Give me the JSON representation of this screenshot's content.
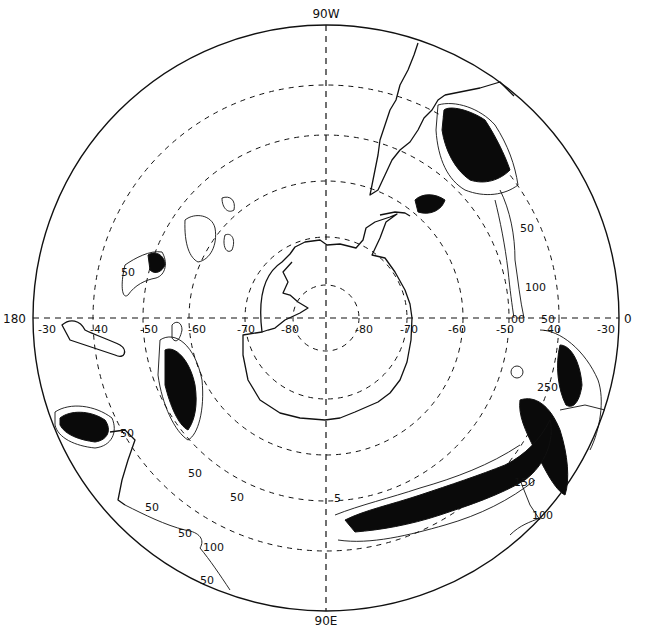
{
  "map": {
    "projection": "south polar stereographic",
    "center": {
      "x": 326,
      "y": 318
    },
    "outer_radius": 293,
    "meridian_labels": {
      "top": "90W",
      "bottom": "90E",
      "left": "180",
      "right": "0"
    },
    "latitude_labels_left": [
      "-30",
      "-40",
      "-50",
      "-60",
      "-70",
      "-80"
    ],
    "latitude_labels_right": [
      "-80",
      "-70",
      "-60",
      "-50",
      "-40",
      "-30"
    ],
    "latitude_circles": [
      {
        "lat": -80,
        "radius": 33
      },
      {
        "lat": -70,
        "radius": 81
      },
      {
        "lat": -60,
        "radius": 137
      },
      {
        "lat": -50,
        "radius": 183
      },
      {
        "lat": -40,
        "radius": 233
      },
      {
        "lat": -30,
        "radius": 293
      }
    ],
    "contour_labels": [
      {
        "text": "50",
        "x": 121,
        "y": 276
      },
      {
        "text": "50",
        "x": 520,
        "y": 232
      },
      {
        "text": "100",
        "x": 525,
        "y": 291
      },
      {
        "text": "00",
        "x": 511,
        "y": 323
      },
      {
        "text": "50",
        "x": 541,
        "y": 323
      },
      {
        "text": "250",
        "x": 537,
        "y": 391
      },
      {
        "text": "150",
        "x": 514,
        "y": 486
      },
      {
        "text": "100",
        "x": 532,
        "y": 519
      },
      {
        "text": "50",
        "x": 120,
        "y": 437
      },
      {
        "text": "50",
        "x": 188,
        "y": 477
      },
      {
        "text": "50",
        "x": 230,
        "y": 501
      },
      {
        "text": "50",
        "x": 145,
        "y": 511
      },
      {
        "text": "50",
        "x": 178,
        "y": 537
      },
      {
        "text": "100",
        "x": 203,
        "y": 551
      },
      {
        "text": "50",
        "x": 200,
        "y": 584
      },
      {
        "text": "5",
        "x": 334,
        "y": 502
      }
    ],
    "colors": {
      "ink": "#111111",
      "background": "#ffffff"
    }
  }
}
